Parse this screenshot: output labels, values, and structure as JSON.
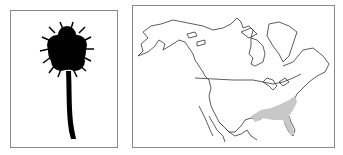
{
  "panels": [
    {
      "id": "tree-silhouette",
      "subject": "palmetto palm tree silhouette"
    },
    {
      "id": "range-map",
      "subject": "North America outline map",
      "highlighted_region": "southeastern United States",
      "highlight_color": "#c8c8c8"
    }
  ],
  "colors": {
    "outline": "#333333",
    "border": "#8a8a8a",
    "range": "#c8c8c8",
    "silhouette": "#000000"
  }
}
